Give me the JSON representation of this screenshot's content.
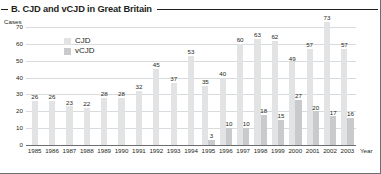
{
  "header": {
    "title": "B. CJD and vCJD in Great Britain"
  },
  "axes": {
    "ylabel": "Cases",
    "xlabel": "Year"
  },
  "legend": {
    "items": [
      {
        "label": "CJD",
        "color": "#e2e3e4",
        "swatch_name": "legend-swatch-cjd"
      },
      {
        "label": "vCJD",
        "color": "#c9cacc",
        "swatch_name": "legend-swatch-vcjd"
      }
    ]
  },
  "chart_data": {
    "type": "bar",
    "title": "B. CJD and vCJD in Great Britain",
    "xlabel": "Year",
    "ylabel": "Cases",
    "ylim": [
      0,
      70
    ],
    "yticks": [
      0,
      10,
      20,
      30,
      40,
      50,
      60,
      70
    ],
    "grid": true,
    "legend_position": "upper-left-inside",
    "categories": [
      "1985",
      "1986",
      "1987",
      "1988",
      "1989",
      "1990",
      "1991",
      "1992",
      "1993",
      "1994",
      "1995",
      "1996",
      "1997",
      "1998",
      "1999",
      "2000",
      "2001",
      "2002",
      "2003"
    ],
    "series": [
      {
        "name": "CJD",
        "color": "#e2e3e4",
        "values": [
          26,
          26,
          23,
          22,
          28,
          28,
          32,
          45,
          37,
          53,
          35,
          40,
          60,
          63,
          62,
          49,
          57,
          73,
          57
        ]
      },
      {
        "name": "vCJD",
        "color": "#c9cacc",
        "values": [
          null,
          null,
          null,
          null,
          null,
          null,
          null,
          null,
          null,
          null,
          3,
          10,
          10,
          18,
          15,
          27,
          20,
          17,
          16
        ]
      }
    ]
  }
}
